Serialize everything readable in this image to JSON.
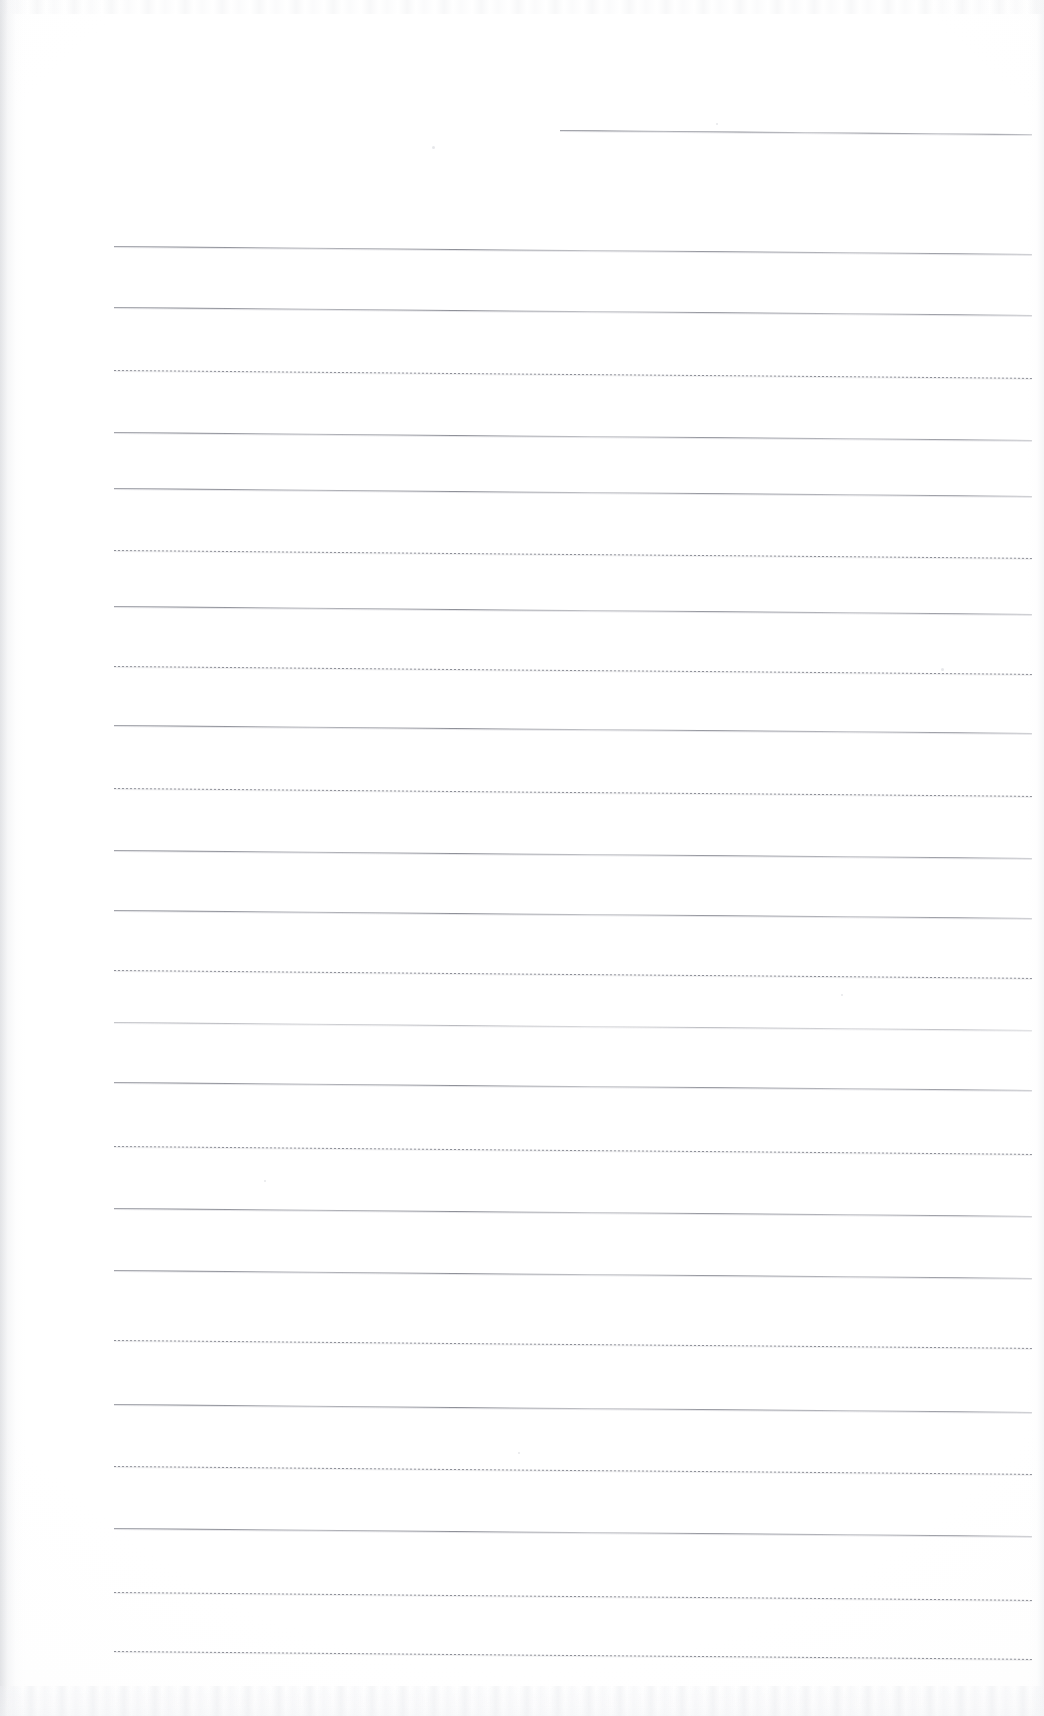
{
  "document": {
    "kind": "scanned-page",
    "title": "Blank ruled notebook page",
    "page_width": 1044,
    "page_height": 1716,
    "background_color": "#ffffff",
    "paper_tone": "#fdfdfd",
    "rule_color": "#84868f",
    "rule_halo_color": "#afb1b8",
    "text_content": "",
    "visible_text_count": 0
  },
  "scan_artifacts": {
    "left_edge_shadow": true,
    "right_edge_shadow": true,
    "top_edge_noise": true,
    "bottom_edge_noise": true,
    "page_skew_degrees": 0.5,
    "specks": [
      {
        "x": 432,
        "y": 146,
        "size": 3
      },
      {
        "x": 716,
        "y": 123,
        "size": 2
      },
      {
        "x": 941,
        "y": 668,
        "size": 3
      },
      {
        "x": 841,
        "y": 994,
        "size": 2
      },
      {
        "x": 518,
        "y": 1452,
        "size": 2
      },
      {
        "x": 264,
        "y": 1180,
        "size": 2
      }
    ]
  },
  "ruling": {
    "line_count": 22,
    "left_margin_x": 114,
    "right_margin_x": 1032,
    "short_first_line_start_x": 560,
    "nominal_spacing_px": 66,
    "slope_px_over_width": 9,
    "lines": [
      {
        "index": 1,
        "y": 130,
        "x_start": 560,
        "x_end": 1032,
        "style": "solid"
      },
      {
        "index": 2,
        "y": 246,
        "x_start": 114,
        "x_end": 1032,
        "style": "solid"
      },
      {
        "index": 3,
        "y": 307,
        "x_start": 114,
        "x_end": 1032,
        "style": "solid"
      },
      {
        "index": 4,
        "y": 370,
        "x_start": 114,
        "x_end": 1032,
        "style": "dotted"
      },
      {
        "index": 5,
        "y": 432,
        "x_start": 114,
        "x_end": 1032,
        "style": "solid"
      },
      {
        "index": 6,
        "y": 488,
        "x_start": 114,
        "x_end": 1032,
        "style": "solid"
      },
      {
        "index": 7,
        "y": 550,
        "x_start": 114,
        "x_end": 1032,
        "style": "dotted"
      },
      {
        "index": 8,
        "y": 606,
        "x_start": 114,
        "x_end": 1032,
        "style": "solid"
      },
      {
        "index": 9,
        "y": 666,
        "x_start": 114,
        "x_end": 1032,
        "style": "dotted"
      },
      {
        "index": 10,
        "y": 725,
        "x_start": 114,
        "x_end": 1032,
        "style": "solid"
      },
      {
        "index": 11,
        "y": 788,
        "x_start": 114,
        "x_end": 1032,
        "style": "dotted"
      },
      {
        "index": 12,
        "y": 850,
        "x_start": 114,
        "x_end": 1032,
        "style": "solid"
      },
      {
        "index": 13,
        "y": 910,
        "x_start": 114,
        "x_end": 1032,
        "style": "solid"
      },
      {
        "index": 14,
        "y": 970,
        "x_start": 114,
        "x_end": 1032,
        "style": "dotted"
      },
      {
        "index": 15,
        "y": 1022,
        "x_start": 114,
        "x_end": 1032,
        "style": "faint"
      },
      {
        "index": 16,
        "y": 1082,
        "x_start": 114,
        "x_end": 1032,
        "style": "solid"
      },
      {
        "index": 17,
        "y": 1146,
        "x_start": 114,
        "x_end": 1032,
        "style": "dotted"
      },
      {
        "index": 18,
        "y": 1208,
        "x_start": 114,
        "x_end": 1032,
        "style": "solid"
      },
      {
        "index": 19,
        "y": 1270,
        "x_start": 114,
        "x_end": 1032,
        "style": "solid"
      },
      {
        "index": 20,
        "y": 1340,
        "x_start": 114,
        "x_end": 1032,
        "style": "dotted"
      },
      {
        "index": 21,
        "y": 1404,
        "x_start": 114,
        "x_end": 1032,
        "style": "solid"
      },
      {
        "index": 22,
        "y": 1466,
        "x_start": 114,
        "x_end": 1032,
        "style": "dotted"
      },
      {
        "index": 23,
        "y": 1528,
        "x_start": 114,
        "x_end": 1032,
        "style": "solid"
      },
      {
        "index": 24,
        "y": 1592,
        "x_start": 114,
        "x_end": 1032,
        "style": "dotted"
      },
      {
        "index": 25,
        "y": 1651,
        "x_start": 114,
        "x_end": 1032,
        "style": "dotted"
      }
    ]
  }
}
